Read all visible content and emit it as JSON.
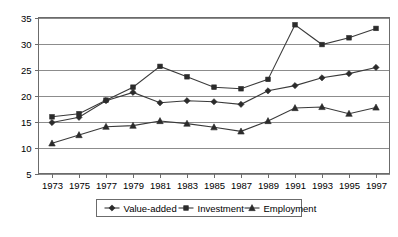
{
  "chart_data": {
    "type": "line",
    "title": "",
    "xlabel": "",
    "ylabel": "",
    "grid": true,
    "legend_position": "bottom",
    "ylim": [
      5,
      35
    ],
    "yticks": [
      5,
      10,
      15,
      20,
      25,
      30,
      35
    ],
    "categories": [
      1973,
      1975,
      1977,
      1979,
      1981,
      1983,
      1985,
      1987,
      1989,
      1991,
      1993,
      1995,
      1997
    ],
    "xtick_labels": [
      "1973",
      "1975",
      "1977",
      "1979",
      "1981",
      "1983",
      "1985",
      "1987",
      "1989",
      "1991",
      "1993",
      "1995",
      "1997"
    ],
    "ytick_labels": [
      "5",
      "10",
      "15",
      "20",
      "25",
      "30",
      "35"
    ],
    "series": [
      {
        "name": "Value-added",
        "marker": "diamond",
        "color": "#2b2b2b",
        "values": [
          14.8,
          15.8,
          19.0,
          20.6,
          18.6,
          19.0,
          18.8,
          18.3,
          20.9,
          21.9,
          23.4,
          24.2,
          25.4
        ]
      },
      {
        "name": "Investment",
        "marker": "square",
        "color": "#2b2b2b",
        "values": [
          15.9,
          16.5,
          19.1,
          21.6,
          25.6,
          23.6,
          21.6,
          21.3,
          23.1,
          33.6,
          29.8,
          31.1,
          32.9
        ]
      },
      {
        "name": "Employment",
        "marker": "triangle",
        "color": "#2b2b2b",
        "values": [
          10.8,
          12.4,
          14.0,
          14.2,
          15.1,
          14.6,
          13.9,
          13.1,
          15.1,
          17.6,
          17.8,
          16.5,
          17.7
        ]
      }
    ]
  },
  "legend": {
    "items": [
      {
        "label": "Value-added",
        "marker": "diamond"
      },
      {
        "label": "Investment",
        "marker": "square"
      },
      {
        "label": "Employment",
        "marker": "triangle"
      }
    ]
  }
}
